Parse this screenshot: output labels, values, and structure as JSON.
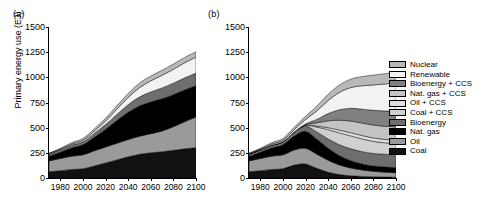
{
  "figure": {
    "panels": [
      {
        "id": "a",
        "label": "(a)"
      },
      {
        "id": "b",
        "label": "(b)"
      }
    ],
    "ylabel": "Primary energy use (EJ)",
    "yticks": [
      0,
      250,
      500,
      750,
      1000,
      1250,
      1500
    ],
    "xticks": [
      1980,
      2000,
      2020,
      2040,
      2060,
      2080,
      2100
    ]
  },
  "legend": {
    "items": [
      {
        "label": "Nuclear",
        "color": "#b8b8b8"
      },
      {
        "label": "Renewable",
        "color": "#f2f2f2"
      },
      {
        "label": "Bioenergy + CCS",
        "color": "#808080"
      },
      {
        "label": "Nat. gas + CCS",
        "color": "#c4c4c4"
      },
      {
        "label": "Oil + CCS",
        "color": "#dedede"
      },
      {
        "label": "Coal + CCS",
        "color": "#d0d0d0"
      },
      {
        "label": "Bioenergy",
        "color": "#6e6e6e"
      },
      {
        "label": "Nat. gas",
        "color": "#000000"
      },
      {
        "label": "Oil",
        "color": "#9a9a9a"
      },
      {
        "label": "Coal",
        "color": "#111111"
      }
    ]
  },
  "chart_data": [
    {
      "type": "area",
      "panel": "a",
      "title": "(a)",
      "xlabel": "",
      "ylabel": "Primary energy use (EJ)",
      "xlim": [
        1970,
        2100
      ],
      "ylim": [
        0,
        1500
      ],
      "grid": false,
      "legend_position": "right-outside",
      "x": [
        1970,
        1980,
        1990,
        2000,
        2010,
        2020,
        2030,
        2040,
        2050,
        2060,
        2070,
        2080,
        2090,
        2100
      ],
      "series": [
        {
          "name": "Coal",
          "values": [
            62,
            72,
            85,
            92,
            120,
            150,
            180,
            210,
            235,
            250,
            262,
            275,
            290,
            300
          ]
        },
        {
          "name": "Oil",
          "values": [
            108,
            122,
            132,
            138,
            150,
            158,
            165,
            172,
            180,
            190,
            205,
            235,
            270,
            305
          ]
        },
        {
          "name": "Nat. gas",
          "values": [
            45,
            62,
            82,
            100,
            135,
            175,
            225,
            270,
            300,
            315,
            320,
            318,
            315,
            312
          ]
        },
        {
          "name": "Bioenergy",
          "values": [
            22,
            24,
            27,
            30,
            38,
            48,
            62,
            76,
            90,
            100,
            108,
            114,
            120,
            124
          ]
        },
        {
          "name": "Coal + CCS",
          "values": [
            0,
            0,
            0,
            0,
            0,
            0,
            0,
            0,
            0,
            0,
            0,
            0,
            0,
            0
          ]
        },
        {
          "name": "Oil + CCS",
          "values": [
            0,
            0,
            0,
            0,
            0,
            0,
            0,
            0,
            0,
            0,
            0,
            0,
            0,
            0
          ]
        },
        {
          "name": "Nat. gas + CCS",
          "values": [
            0,
            0,
            0,
            0,
            0,
            0,
            0,
            0,
            0,
            0,
            0,
            0,
            0,
            0
          ]
        },
        {
          "name": "Bioenergy + CCS",
          "values": [
            0,
            0,
            0,
            0,
            0,
            0,
            0,
            0,
            0,
            0,
            0,
            0,
            0,
            0
          ]
        },
        {
          "name": "Renewable",
          "values": [
            6,
            8,
            11,
            14,
            22,
            34,
            52,
            72,
            92,
            110,
            125,
            138,
            150,
            160
          ]
        },
        {
          "name": "Nuclear",
          "values": [
            2,
            6,
            14,
            18,
            22,
            28,
            34,
            40,
            45,
            48,
            50,
            52,
            53,
            54
          ]
        }
      ],
      "total_2100": 1255
    },
    {
      "type": "area",
      "panel": "b",
      "title": "(b)",
      "xlabel": "",
      "ylabel": "Primary energy use (EJ)",
      "xlim": [
        1970,
        2100
      ],
      "ylim": [
        0,
        1500
      ],
      "grid": false,
      "legend_position": "right-outside",
      "x": [
        1970,
        1980,
        1990,
        2000,
        2010,
        2020,
        2030,
        2040,
        2050,
        2060,
        2070,
        2080,
        2090,
        2100
      ],
      "series": [
        {
          "name": "Coal",
          "values": [
            62,
            72,
            85,
            92,
            128,
            140,
            96,
            58,
            34,
            22,
            16,
            12,
            10,
            8
          ]
        },
        {
          "name": "Oil",
          "values": [
            108,
            122,
            132,
            138,
            150,
            155,
            140,
            118,
            96,
            78,
            64,
            54,
            48,
            44
          ]
        },
        {
          "name": "Nat. gas",
          "values": [
            45,
            62,
            82,
            100,
            138,
            168,
            150,
            120,
            92,
            72,
            60,
            54,
            52,
            52
          ]
        },
        {
          "name": "Bioenergy",
          "values": [
            22,
            24,
            27,
            30,
            40,
            52,
            72,
            92,
            108,
            118,
            122,
            124,
            126,
            128
          ]
        },
        {
          "name": "Coal + CCS",
          "values": [
            0,
            0,
            0,
            0,
            0,
            8,
            48,
            92,
            118,
            128,
            126,
            120,
            114,
            110
          ]
        },
        {
          "name": "Oil + CCS",
          "values": [
            0,
            0,
            0,
            0,
            0,
            2,
            10,
            20,
            28,
            32,
            34,
            34,
            34,
            34
          ]
        },
        {
          "name": "Nat. gas + CCS",
          "values": [
            0,
            0,
            0,
            0,
            0,
            6,
            32,
            68,
            98,
            116,
            124,
            128,
            130,
            132
          ]
        },
        {
          "name": "Bioenergy + CCS",
          "values": [
            0,
            0,
            0,
            0,
            0,
            6,
            34,
            72,
            104,
            126,
            138,
            146,
            152,
            156
          ]
        },
        {
          "name": "Renewable",
          "values": [
            6,
            8,
            11,
            14,
            24,
            44,
            84,
            130,
            172,
            206,
            232,
            252,
            268,
            282
          ]
        },
        {
          "name": "Nuclear",
          "values": [
            2,
            6,
            14,
            18,
            24,
            32,
            48,
            62,
            74,
            84,
            92,
            98,
            102,
            106
          ]
        }
      ],
      "total_2100": 1052
    }
  ]
}
